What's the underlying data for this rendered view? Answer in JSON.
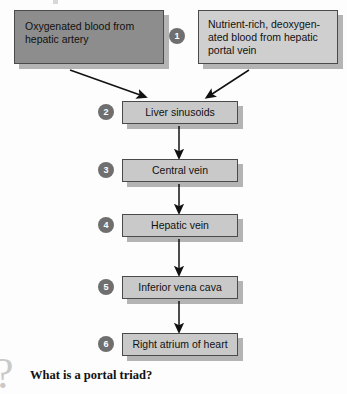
{
  "diagram": {
    "colors": {
      "background": "#fdfdfd",
      "dark_box_fill": "#8d8d8d",
      "light_box_fill": "#cfcfcf",
      "flow_box_fill": "#c9c9c9",
      "box_border": "#4a4a4a",
      "shadow": "#b4b4b4",
      "badge_fill": "#6f6f6f",
      "badge_text": "#ffffff",
      "arrow": "#111111",
      "question_glyph": "#c9c9c9"
    },
    "inputs": [
      {
        "badge": "",
        "label": "Oxygenated blood from hepatic artery",
        "style": "dark"
      },
      {
        "badge": "1",
        "label": "Nutrient-rich, deoxygen-\nated blood from hepatic\nportal vein",
        "style": "light"
      }
    ],
    "steps": [
      {
        "badge": "2",
        "label": "Liver sinusoids"
      },
      {
        "badge": "3",
        "label": "Central vein"
      },
      {
        "badge": "4",
        "label": "Hepatic vein"
      },
      {
        "badge": "5",
        "label": "Inferior vena cava"
      },
      {
        "badge": "6",
        "label": "Right atrium of heart"
      }
    ]
  },
  "footer": {
    "glyph": "?",
    "glyph_name": "question-mark-icon",
    "question": "What is a portal triad?"
  }
}
